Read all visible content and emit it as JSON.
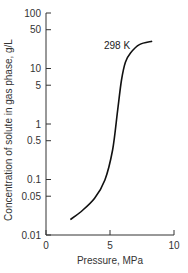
{
  "chart_data": {
    "type": "line",
    "title": "",
    "xlabel": "Pressure, MPa",
    "ylabel": "Concentration of solute in gas phase, g/L",
    "xlim": [
      0,
      10
    ],
    "ylim": [
      0.01,
      100
    ],
    "yscale": "log",
    "grid": false,
    "legend": null,
    "x_ticks": [
      {
        "value": 0,
        "label": "0"
      },
      {
        "value": 5,
        "label": "5"
      },
      {
        "value": 10,
        "label": "10"
      }
    ],
    "y_ticks": [
      {
        "value": 100,
        "label": "100"
      },
      {
        "value": 50,
        "label": "50"
      },
      {
        "value": 10,
        "label": "10"
      },
      {
        "value": 5,
        "label": "5"
      },
      {
        "value": 1,
        "label": "1"
      },
      {
        "value": 0.5,
        "label": "0.5"
      },
      {
        "value": 0.1,
        "label": "0.1"
      },
      {
        "value": 0.05,
        "label": "0.05"
      },
      {
        "value": 0.01,
        "label": "0.01"
      }
    ],
    "series": [
      {
        "name": "298 K",
        "x": [
          1.9,
          2.7,
          3.8,
          4.6,
          5.2,
          5.6,
          5.9,
          6.2,
          6.6,
          7.3,
          8.3
        ],
        "y": [
          0.019,
          0.026,
          0.046,
          0.098,
          0.34,
          1.8,
          6.2,
          13,
          19,
          27,
          31
        ]
      }
    ],
    "annotations": [
      {
        "text": "298 K",
        "x": 5.6,
        "y": 25
      }
    ],
    "colors": {
      "line": "#111111",
      "axis": "#333333"
    }
  }
}
